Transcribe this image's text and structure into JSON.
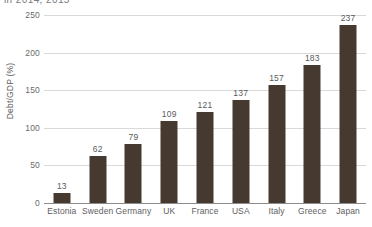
{
  "title_clipped": "in 2014, 2015",
  "chart_data": {
    "type": "bar",
    "title": "",
    "xlabel": "",
    "ylabel": "Debt/GDP (%)",
    "categories": [
      "Estonia",
      "Sweden",
      "Germany",
      "UK",
      "France",
      "USA",
      "Italy",
      "Greece",
      "Japan"
    ],
    "values": [
      13,
      62,
      79,
      109,
      121,
      137,
      157,
      183,
      237
    ],
    "value_labels": [
      "13",
      "62",
      "79",
      "109",
      "121",
      "137",
      "157",
      "183",
      "237"
    ],
    "ylim": [
      0,
      250
    ],
    "yticks": [
      0,
      50,
      100,
      150,
      200,
      250
    ],
    "ytick_labels": [
      "0",
      "50",
      "100",
      "150",
      "200",
      "250"
    ],
    "grid": true,
    "legend": "none",
    "bar_color": "#46392f",
    "gridline_color": "#d9d9d9",
    "axis_color": "#8d8d8d",
    "text_color": "#5e5e5e"
  }
}
